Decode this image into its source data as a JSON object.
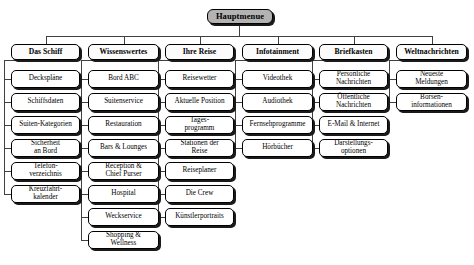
{
  "diagram": {
    "title": "Hauptmenue",
    "root": {
      "label": "Hauptmenue"
    },
    "colors": {
      "root_fill": "#b3b3b3",
      "header_fill": "#fbfbfb",
      "leaf_fill": "#ffffff",
      "border": "#000000",
      "shadow": "#1a1a1a",
      "connector": "#404040",
      "background": "#ffffff"
    },
    "columns": [
      {
        "header": "Das Schiff",
        "items": [
          "Deckspläne",
          "Schiffsdaten",
          "Suiten-Kategorien",
          "Sicherheit\nan Bord",
          "Telefon-\nverzeichnis",
          "Kreuzfahrt-\nkalender"
        ]
      },
      {
        "header": "Wissenswertes",
        "items": [
          "Bord ABC",
          "Suitenservice",
          "Restauration",
          "Bars & Lounges",
          "Reception &\nChief Purser",
          "Hospital",
          "Weckservice",
          "Shopping &\nWellness"
        ]
      },
      {
        "header": "Ihre Reise",
        "items": [
          "Reisewetter",
          "Aktuelle Position",
          "Tages-\nprogramm",
          "Stationen der\nReise",
          "Reiseplaner",
          "Die Crew",
          "Künstlerportraits"
        ]
      },
      {
        "header": "Infotainment",
        "items": [
          "Videothek",
          "Audiothek",
          "Fernsehprogramme",
          "Hörbücher"
        ]
      },
      {
        "header": "Briefkasten",
        "items": [
          "Persönliche\nNachrichten",
          "Öffentliche\nNachrichten",
          "E-Mail & Internet",
          "Darstellungs-\noptionen"
        ]
      },
      {
        "header": "Weltnachrichten",
        "items": [
          "Neueste\nMeldungen",
          "Börsen-\ninformationen"
        ]
      }
    ]
  }
}
